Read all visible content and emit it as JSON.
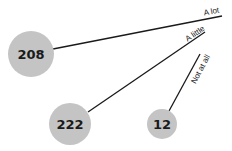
{
  "diagram": {
    "nodes": [
      {
        "id": "n1",
        "value": "208",
        "cx": 31,
        "cy": 54,
        "r": 23
      },
      {
        "id": "n2",
        "value": "222",
        "cx": 70,
        "cy": 124,
        "r": 21
      },
      {
        "id": "n3",
        "value": "12",
        "cx": 162,
        "cy": 124,
        "r": 15
      }
    ],
    "edges": [
      {
        "label": "A lot",
        "from": "n1"
      },
      {
        "label": "A little",
        "from": "n2"
      },
      {
        "label": "Not at all",
        "from": "n3"
      }
    ],
    "colors": {
      "node_fill": "#c4c4c4",
      "line": "#1a1a1a"
    }
  }
}
